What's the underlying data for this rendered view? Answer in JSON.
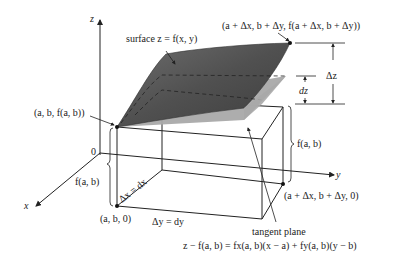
{
  "diagram": {
    "axes": {
      "z_label": "z",
      "x_label": "x",
      "y_label": "y",
      "origin_label": "0"
    },
    "labels": {
      "surface": "surface z = f(x, y)",
      "top_point": "(a + Δx, b + Δy, f(a + Δx, b + Δy))",
      "base_point_surface": "(a, b, f(a, b))",
      "delta_z": "Δz",
      "dz": "dz",
      "f_ab_right": "f(a, b)",
      "f_ab_left": "f(a, b)",
      "delta_x": "Δx = dx",
      "delta_y": "Δy = dy",
      "base_point_floor": "(a, b, 0)",
      "far_point_floor": "(a + Δx, b + Δy, 0)",
      "tangent_plane": "tangent plane",
      "tangent_equation": "z − f(a, b) = fx(a, b)(x − a) + fy(a, b)(y − b)"
    },
    "colors": {
      "surface_dark": "#4a4a4a",
      "surface_mid": "#777777",
      "tangent_plane": "#a9a9a9",
      "line": "#222222"
    }
  }
}
